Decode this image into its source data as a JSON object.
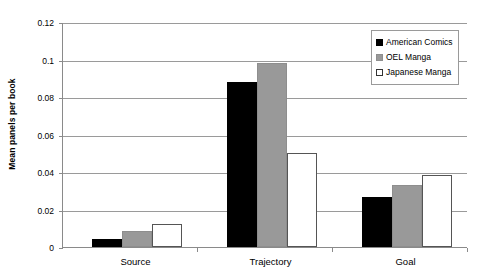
{
  "chart_data": {
    "type": "bar",
    "title": "",
    "xlabel": "",
    "ylabel": "Mean panels per book",
    "categories": [
      "Source",
      "Trajectory",
      "Goal"
    ],
    "series": [
      {
        "name": "American Comics",
        "color": "#000000",
        "values": [
          0.0045,
          0.088,
          0.0265
        ]
      },
      {
        "name": "OEL Manga",
        "color": "#999999",
        "values": [
          0.0085,
          0.098,
          0.0333
        ]
      },
      {
        "name": "Japanese Manga",
        "color": "#ffffff",
        "values": [
          0.0125,
          0.05,
          0.0385
        ]
      }
    ],
    "ylim": [
      0,
      0.12
    ],
    "y_ticks": [
      0,
      0.02,
      0.04,
      0.06,
      0.08,
      0.1,
      0.12
    ],
    "y_tick_labels": [
      "0",
      "0.02",
      "0.04",
      "0.06",
      "0.08",
      "0.1",
      "0.12"
    ],
    "grid": true,
    "legend_position": "top-right"
  },
  "legend": {
    "entries": [
      {
        "label": "American Comics",
        "swatch": "filled-black-square"
      },
      {
        "label": "OEL Manga",
        "swatch": "filled-gray-square"
      },
      {
        "label": "Japanese Manga",
        "swatch": "outlined-white-square"
      }
    ]
  }
}
